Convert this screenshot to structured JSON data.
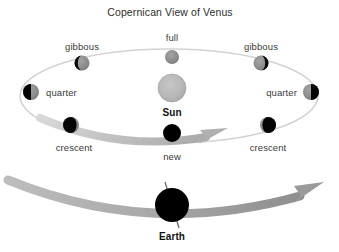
{
  "figure": {
    "title": "Copernican View of Venus",
    "background_color": "#ffffff",
    "width": 339,
    "height": 252
  },
  "colors": {
    "title_text": "#2e2e2e",
    "phase_label_text": "#3a3a3a",
    "body_label_text": "#111111",
    "sun_fill": "#b5b5b5",
    "sun_edge": "#9a9a9a",
    "orbit_line": "#cfcfcf",
    "arrow_gray": "#9c9c9c",
    "arrow_gray_dark": "#8a8a8a",
    "venus_lit": "#8c8c8c",
    "venus_dark": "#050505",
    "earth_fill": "#000000",
    "earth_axis": "#6f6f6f"
  },
  "sun": {
    "label": "Sun",
    "cx": 172,
    "cy": 88,
    "radius": 14
  },
  "earth": {
    "label": "Earth",
    "cx": 172,
    "cy": 205,
    "radius": 17,
    "axis_tilt_deg": 23
  },
  "venus_orbit": {
    "cx": 169,
    "cy": 96,
    "rx": 149,
    "ry": 47,
    "description": "Venus orbit ellipse around the Sun"
  },
  "earth_orbit_arrow": {
    "description": "Earth's orbital path arc, arrowhead pointing right"
  },
  "venus_orbit_arrow": {
    "description": "Venus orbital direction arrow along lower orbit, pointing right"
  },
  "phases": [
    {
      "name": "full",
      "label": "full",
      "cx": 172,
      "cy": 57,
      "r": 7,
      "lit": "full",
      "label_x": 172,
      "label_y": 33,
      "label_align": "center"
    },
    {
      "name": "gibbous-left",
      "label": "gibbous",
      "cx": 82,
      "cy": 63,
      "r": 7.5,
      "lit": "gibbous-right",
      "label_x": 82,
      "label_y": 42,
      "label_align": "center"
    },
    {
      "name": "gibbous-right",
      "label": "gibbous",
      "cx": 261,
      "cy": 63,
      "r": 7.5,
      "lit": "gibbous-left",
      "label_x": 261,
      "label_y": 42,
      "label_align": "center"
    },
    {
      "name": "quarter-left",
      "label": "quarter",
      "cx": 31,
      "cy": 92,
      "r": 8,
      "lit": "right-half",
      "label_x": 46,
      "label_y": 88,
      "label_align": "left"
    },
    {
      "name": "quarter-right",
      "label": "quarter",
      "cx": 311,
      "cy": 92,
      "r": 8,
      "lit": "left-half",
      "label_x": 297,
      "label_y": 88,
      "label_align": "right"
    },
    {
      "name": "crescent-left",
      "label": "crescent",
      "cx": 71,
      "cy": 125,
      "r": 8,
      "lit": "crescent-right",
      "label_x": 74,
      "label_y": 143,
      "label_align": "center"
    },
    {
      "name": "crescent-right",
      "label": "crescent",
      "cx": 268,
      "cy": 125,
      "r": 8,
      "lit": "crescent-left",
      "label_x": 268,
      "label_y": 143,
      "label_align": "center"
    },
    {
      "name": "new",
      "label": "new",
      "cx": 172,
      "cy": 133,
      "r": 9,
      "lit": "none",
      "label_x": 172,
      "label_y": 152,
      "label_align": "center"
    }
  ]
}
